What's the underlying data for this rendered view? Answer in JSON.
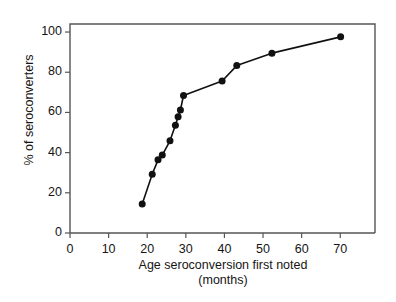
{
  "chart_data": {
    "type": "line",
    "title": "",
    "xlabel": "Age seroconversion  first noted",
    "xlabel_line2": "(months)",
    "ylabel": "% of seroconverters",
    "xlim": [
      0,
      79
    ],
    "ylim": [
      0,
      104
    ],
    "xticks": [
      0,
      10,
      20,
      30,
      40,
      50,
      60,
      70
    ],
    "xtick_labels": [
      "0",
      "10",
      "20",
      "30",
      "40",
      "50",
      "60",
      "70"
    ],
    "yticks": [
      0,
      20,
      40,
      60,
      80,
      100
    ],
    "ytick_labels": [
      "0",
      "20",
      "40",
      "60",
      "80",
      "100"
    ],
    "grid": false,
    "legend": null,
    "marker": "filled-circle",
    "marker_color": "#111111",
    "line_color": "#111111",
    "x": [
      18.7,
      21.3,
      22.8,
      23.9,
      25.9,
      27.3,
      28.0,
      28.6,
      29.4,
      39.4,
      43.2,
      52.3,
      70.1
    ],
    "y": [
      14.4,
      29.2,
      36.4,
      38.8,
      45.9,
      53.6,
      57.9,
      61.2,
      68.4,
      75.6,
      83.3,
      89.5,
      97.6
    ],
    "points": [
      {
        "x": 18.7,
        "y": 14.4
      },
      {
        "x": 21.3,
        "y": 29.2
      },
      {
        "x": 22.8,
        "y": 36.4
      },
      {
        "x": 23.9,
        "y": 38.8
      },
      {
        "x": 25.9,
        "y": 45.9
      },
      {
        "x": 27.3,
        "y": 53.6
      },
      {
        "x": 28.0,
        "y": 57.9
      },
      {
        "x": 28.6,
        "y": 61.2
      },
      {
        "x": 29.4,
        "y": 68.4
      },
      {
        "x": 39.4,
        "y": 75.6
      },
      {
        "x": 43.2,
        "y": 83.3
      },
      {
        "x": 52.3,
        "y": 89.5
      },
      {
        "x": 70.1,
        "y": 97.6
      }
    ]
  },
  "axes": {
    "frame_color": "#555555",
    "tick_color": "#555555"
  }
}
